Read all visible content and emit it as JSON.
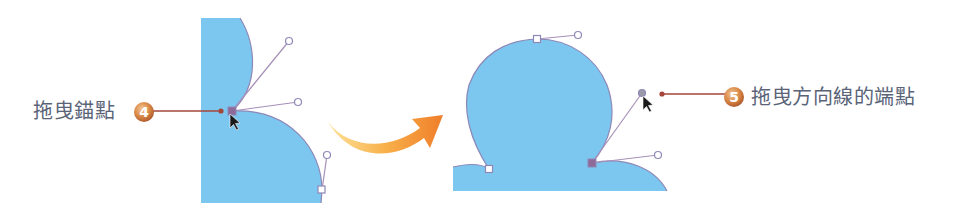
{
  "callouts": [
    {
      "step": "4",
      "label": "拖曳錨點"
    },
    {
      "step": "5",
      "label": "拖曳方向線的端點"
    }
  ],
  "colors": {
    "shape_fill": "#7cc7ef",
    "shape_stroke": "#8d88b8",
    "handle_line": "#a690b8",
    "selected_anchor": "#8e6a98",
    "callout_line": "#a5463a",
    "badge_dark": "#b8612c",
    "badge_light": "#f0c08a",
    "arrow_light": "#fcd27a",
    "arrow_dark": "#f08a2c",
    "label_text": "#5a6478"
  }
}
